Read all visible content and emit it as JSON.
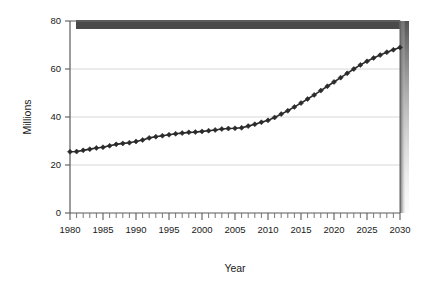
{
  "chart_data": {
    "type": "line",
    "title": "",
    "subtitle": "",
    "xlabel": "Year",
    "ylabel": "Millions",
    "xlim": [
      1980,
      2030
    ],
    "ylim": [
      0,
      80
    ],
    "grid": true,
    "legend": null,
    "y_ticks": [
      0,
      20,
      40,
      60,
      80
    ],
    "x_ticks_major": [
      1980,
      1985,
      1990,
      1995,
      2000,
      2005,
      2010,
      2015,
      2020,
      2025,
      2030
    ],
    "x_minor_tick_step": 1,
    "marker": "diamond",
    "series": [
      {
        "name": "Population",
        "color": "#2b2b2b",
        "x": [
          1980,
          1981,
          1982,
          1983,
          1984,
          1985,
          1986,
          1987,
          1988,
          1989,
          1990,
          1991,
          1992,
          1993,
          1994,
          1995,
          1996,
          1997,
          1998,
          1999,
          2000,
          2001,
          2002,
          2003,
          2004,
          2005,
          2006,
          2007,
          2008,
          2009,
          2010,
          2011,
          2012,
          2013,
          2014,
          2015,
          2016,
          2017,
          2018,
          2019,
          2020,
          2021,
          2022,
          2023,
          2024,
          2025,
          2026,
          2027,
          2028,
          2029,
          2030
        ],
        "values": [
          25.5,
          25.6,
          26.1,
          26.6,
          27.1,
          27.4,
          28.0,
          28.6,
          29.0,
          29.3,
          29.8,
          30.4,
          31.3,
          31.8,
          32.2,
          32.6,
          33.0,
          33.3,
          33.6,
          33.7,
          34.0,
          34.3,
          34.6,
          35.0,
          35.2,
          35.3,
          35.5,
          36.2,
          37.0,
          37.8,
          38.6,
          39.8,
          41.2,
          42.6,
          44.2,
          45.8,
          47.5,
          49.2,
          51.0,
          52.8,
          54.6,
          56.4,
          58.2,
          60.0,
          61.7,
          63.2,
          64.6,
          65.8,
          67.0,
          68.0,
          69.0
        ]
      }
    ],
    "annotations": [
      {
        "name": "top-shadow-band",
        "color": "#4a4a4a"
      },
      {
        "name": "right-shadow-gradient",
        "color": "#6e6e6e"
      }
    ]
  },
  "figure": {
    "xlabel": "Year",
    "ylabel": "Millions",
    "y_tick_labels": [
      "0",
      "20",
      "40",
      "60",
      "80"
    ],
    "x_tick_labels": [
      "1980",
      "1985",
      "1990",
      "1995",
      "2000",
      "2005",
      "2010",
      "2015",
      "2020",
      "2025",
      "2030"
    ]
  }
}
